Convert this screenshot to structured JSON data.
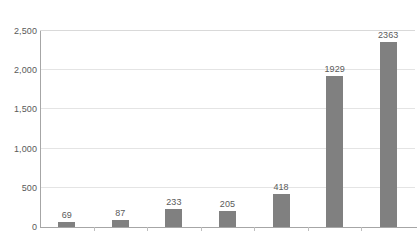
{
  "chart_data": {
    "type": "bar",
    "title": "",
    "subtitle": "",
    "xlabel": "",
    "ylabel": "",
    "categories": [
      "",
      "",
      "",
      "",
      "",
      "",
      ""
    ],
    "values": [
      69,
      87,
      233,
      205,
      418,
      1929,
      2363
    ],
    "data_labels": [
      "69",
      "87",
      "233",
      "205",
      "418",
      "1929",
      "2363"
    ],
    "ylim": [
      0,
      2500
    ],
    "y_ticks": [
      0,
      500,
      1000,
      1500,
      2000,
      2500
    ],
    "y_tick_labels": [
      "0",
      "500",
      "1,000",
      "1,500",
      "2,000",
      "2,500"
    ],
    "grid": "horizontal",
    "legend": "none",
    "bar_color": "#808080",
    "gridline_color": "#e4e4e4",
    "axis_color": "#a6a6a6",
    "label_color": "#595959",
    "background": "#ffffff"
  }
}
